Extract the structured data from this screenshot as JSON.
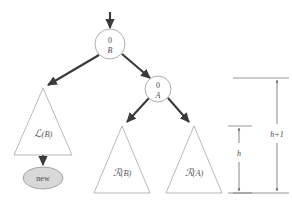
{
  "figure": {
    "colors": {
      "background": "#ffffff",
      "node_stroke": "#8a8a8a",
      "triangle_stroke": "#9a9a9a",
      "edge_arrow": "#3a3a3a",
      "new_node_fill": "#d8d8d8",
      "measure_line": "#6a6a6a",
      "text": "#4a4a4a"
    }
  },
  "nodes": [
    {
      "id": "node-b",
      "name": "node-b",
      "balance": "0",
      "label": "B",
      "cx": 110,
      "cy": 44,
      "r": 15
    },
    {
      "id": "node-a",
      "name": "node-a",
      "balance": "0",
      "label": "A",
      "cx": 158,
      "cy": 89,
      "r": 13
    }
  ],
  "new_node": {
    "label": "new",
    "cx": 43,
    "cy": 178,
    "rx": 20,
    "ry": 11
  },
  "subtrees": [
    {
      "id": "subtree-l-b",
      "name": "subtree-left-of-b",
      "script": "ℒ",
      "argument": "(B)",
      "label": "ℒ(B)",
      "apex_x": 43,
      "apex_y": 88,
      "base_y": 155,
      "half_width": 29
    },
    {
      "id": "subtree-r-b",
      "name": "subtree-right-of-b",
      "script": "ℛ",
      "argument": "(B)",
      "label": "ℛ(B)",
      "apex_x": 122,
      "apex_y": 126,
      "base_y": 193,
      "half_width": 28
    },
    {
      "id": "subtree-r-a",
      "name": "subtree-right-of-a",
      "script": "ℛ",
      "argument": "(A)",
      "label": "ℛ(A)",
      "apex_x": 194,
      "apex_y": 126,
      "base_y": 193,
      "half_width": 28
    }
  ],
  "edges": [
    {
      "name": "incoming-edge-to-b",
      "from": "top",
      "to": "node-b"
    },
    {
      "name": "edge-b-to-left-subtree",
      "from": "node-b",
      "to": "subtree-l-b"
    },
    {
      "name": "edge-b-to-node-a",
      "from": "node-b",
      "to": "node-a"
    },
    {
      "name": "edge-a-to-right-subtree-b",
      "from": "node-a",
      "to": "subtree-r-b"
    },
    {
      "name": "edge-a-to-right-subtree-a",
      "from": "node-a",
      "to": "subtree-r-a"
    },
    {
      "name": "edge-left-subtree-to-new",
      "from": "subtree-l-b",
      "to": "new_node"
    }
  ],
  "measurements": [
    {
      "id": "measure-h",
      "name": "height-measure-h",
      "label": "h",
      "x": 239,
      "top_y": 126,
      "bottom_y": 193,
      "tick_left": 228,
      "tick_right": 252
    },
    {
      "id": "measure-h-plus-1",
      "name": "height-measure-h-plus-1",
      "label": "h+1",
      "x": 277,
      "top_y": 78,
      "bottom_y": 193,
      "tick_left": 233,
      "tick_right": 289
    }
  ]
}
